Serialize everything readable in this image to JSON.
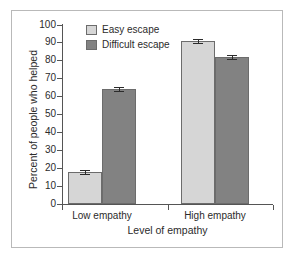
{
  "chart_data": {
    "type": "bar",
    "title": "",
    "xlabel": "Level of empathy",
    "ylabel": "Percent of people who helped",
    "categories": [
      "Low empathy",
      "High empathy"
    ],
    "series": [
      {
        "name": "Easy escape",
        "values": [
          18,
          91
        ],
        "errors": [
          0.8,
          0.8
        ],
        "color": "#d6d6d6"
      },
      {
        "name": "Difficult escape",
        "values": [
          64,
          82
        ],
        "errors": [
          0.8,
          0.8
        ],
        "color": "#828282"
      }
    ],
    "ylim": [
      0,
      100
    ],
    "yticks": [
      0,
      10,
      20,
      30,
      40,
      50,
      60,
      70,
      80,
      90,
      100
    ],
    "ytick_labels": [
      "0",
      "10",
      "20",
      "30",
      "40",
      "50",
      "60",
      "70",
      "80",
      "90",
      "100"
    ],
    "grid": false,
    "legend_position": "top-left-inside",
    "error_bars": true
  },
  "axes": {
    "y_title": "Percent of people who helped",
    "x_title": "Level of empathy",
    "y_labels": [
      "100",
      "90",
      "80",
      "70",
      "60",
      "50",
      "40",
      "30",
      "20",
      "10",
      "0"
    ],
    "x_labels": [
      "Low empathy",
      "High empathy"
    ]
  },
  "legend": {
    "items": [
      {
        "label": "Easy escape",
        "swatch": "light-gray-swatch"
      },
      {
        "label": "Difficult escape",
        "swatch": "dark-gray-swatch"
      }
    ]
  },
  "colors": {
    "easy_escape": "#d6d6d6",
    "difficult_escape": "#828282",
    "axis": "#555555",
    "frame": "#b9b9b9",
    "text": "#2b2b2b"
  }
}
